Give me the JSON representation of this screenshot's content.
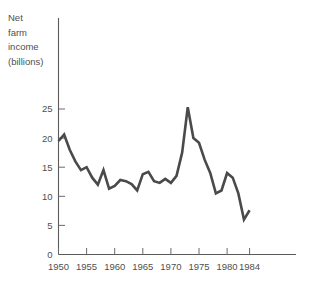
{
  "chart_data": {
    "type": "line",
    "title": "",
    "title_lines": [
      "Net",
      "farm",
      "income",
      "(billions)"
    ],
    "xlabel": "",
    "ylabel": "Net farm income (billions)",
    "grid": false,
    "legend": null,
    "line_color": "#4a4a4a",
    "axis_color": "#5a5a5a",
    "xlim": [
      1950,
      1985
    ],
    "ylim": [
      0,
      28
    ],
    "yticks": [
      0,
      5,
      10,
      15,
      20,
      25
    ],
    "ytick_labels": [
      "0",
      "5",
      "10",
      "15",
      "20",
      "25"
    ],
    "xticks": [
      1950,
      1955,
      1960,
      1965,
      1970,
      1975,
      1980,
      1984
    ],
    "xtick_labels": [
      "1950",
      "1955",
      "1960",
      "1965",
      "1970",
      "1975",
      "1980",
      "1984"
    ],
    "x": [
      1950,
      1951,
      1952,
      1953,
      1954,
      1955,
      1956,
      1957,
      1958,
      1959,
      1960,
      1961,
      1962,
      1963,
      1964,
      1965,
      1966,
      1967,
      1968,
      1969,
      1970,
      1971,
      1972,
      1973,
      1974,
      1975,
      1976,
      1977,
      1978,
      1979,
      1980,
      1981,
      1982,
      1983,
      1984
    ],
    "values": [
      19.5,
      20.6,
      18.0,
      16.0,
      14.5,
      15.0,
      13.2,
      12.0,
      14.5,
      11.3,
      11.8,
      12.8,
      12.6,
      12.1,
      11.0,
      13.8,
      14.2,
      12.6,
      12.3,
      13.0,
      12.3,
      13.5,
      17.5,
      25.3,
      20.0,
      19.2,
      16.3,
      14.0,
      10.5,
      11.0,
      14.0,
      13.2,
      10.5,
      6.0,
      7.6
    ],
    "series_name": "Net farm income"
  }
}
